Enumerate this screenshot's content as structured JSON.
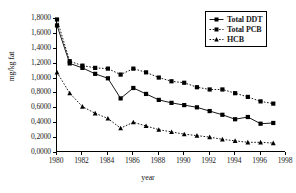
{
  "chart_data": {
    "type": "line",
    "title": "",
    "xlabel": "year",
    "ylabel": "mg/kg fat",
    "xlim": [
      1980,
      1998
    ],
    "ylim": [
      0.0,
      1.8
    ],
    "grid": false,
    "legend_position": "top-right",
    "x_ticks": [
      1980,
      1982,
      1984,
      1986,
      1988,
      1990,
      1992,
      1994,
      1996,
      1998
    ],
    "x_tick_labels": [
      "1980",
      "1982",
      "1984",
      "1986",
      "1988",
      "1990",
      "1992",
      "1994",
      "1996",
      "1998"
    ],
    "y_ticks": [
      0.0,
      0.2,
      0.4,
      0.6,
      0.8,
      1.0,
      1.2,
      1.4,
      1.6,
      1.8
    ],
    "y_tick_labels": [
      "0,0000",
      "0,2000",
      "0,4000",
      "0,6000",
      "0,8000",
      "1,0000",
      "1,2000",
      "1,4000",
      "1,6000",
      "1,8000"
    ],
    "x": [
      1980,
      1981,
      1982,
      1983,
      1984,
      1985,
      1986,
      1987,
      1988,
      1989,
      1990,
      1991,
      1992,
      1993,
      1994,
      1995,
      1996,
      1997
    ],
    "series": [
      {
        "name": "Total DDT",
        "marker": "square",
        "line_style": "solid",
        "color": "#000000",
        "values": [
          1.7,
          1.19,
          1.13,
          1.05,
          0.99,
          0.72,
          0.86,
          0.78,
          0.7,
          0.66,
          0.63,
          0.6,
          0.55,
          0.5,
          0.44,
          0.47,
          0.38,
          0.39
        ]
      },
      {
        "name": "Total PCB",
        "marker": "square",
        "line_style": "dotted",
        "color": "#000000",
        "values": [
          1.78,
          1.22,
          1.16,
          1.13,
          1.12,
          1.04,
          1.12,
          1.07,
          1.0,
          0.95,
          0.93,
          0.87,
          0.84,
          0.84,
          0.79,
          0.74,
          0.68,
          0.65
        ]
      },
      {
        "name": "HCB",
        "marker": "triangle",
        "line_style": "dotted",
        "color": "#000000",
        "values": [
          1.07,
          0.79,
          0.61,
          0.52,
          0.45,
          0.32,
          0.4,
          0.35,
          0.3,
          0.27,
          0.24,
          0.22,
          0.2,
          0.17,
          0.15,
          0.13,
          0.13,
          0.12
        ]
      }
    ]
  }
}
